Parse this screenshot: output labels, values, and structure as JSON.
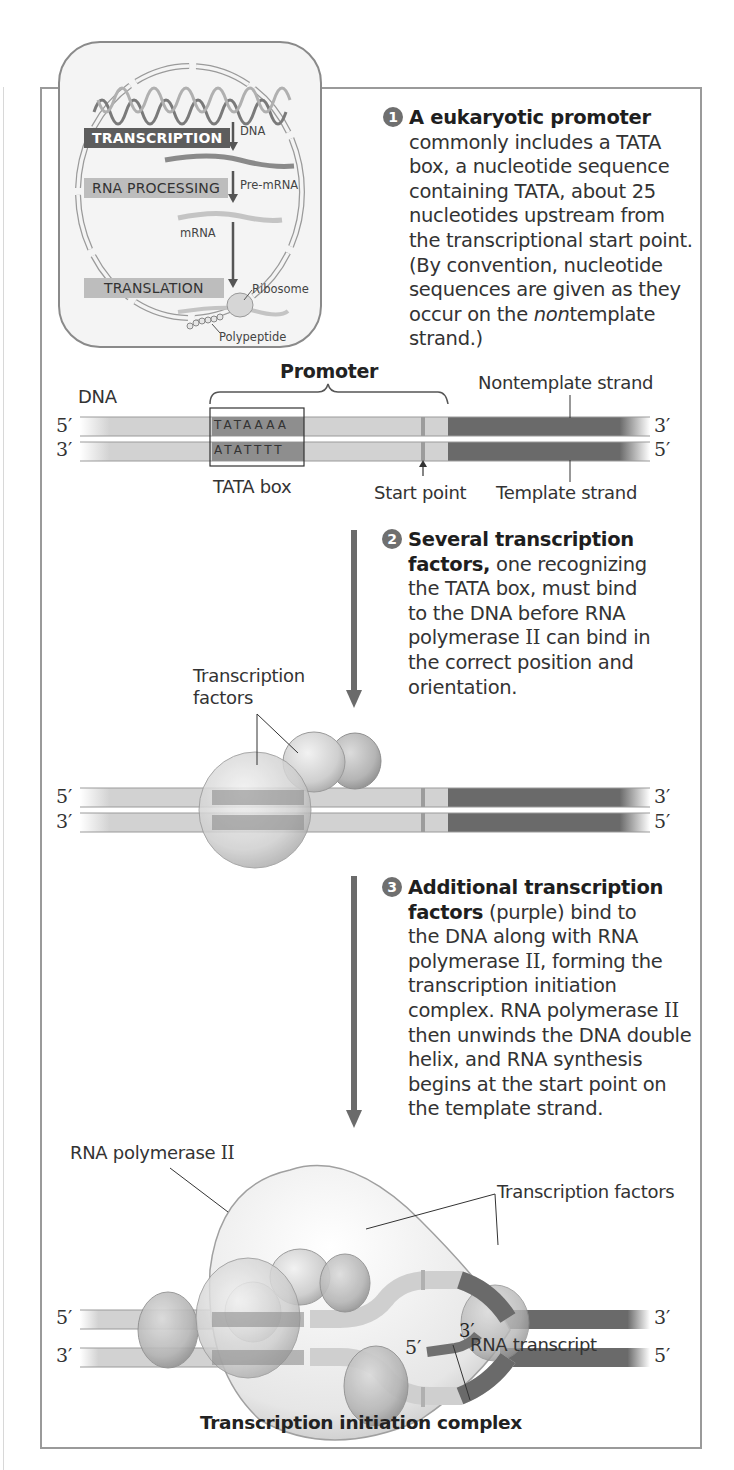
{
  "inset": {
    "labels": {
      "transcription": "TRANSCRIPTION",
      "rna_processing": "RNA PROCESSING",
      "translation": "TRANSLATION",
      "dna": "DNA",
      "pre_mrna": "Pre-mRNA",
      "mrna": "mRNA",
      "ribosome": "Ribosome",
      "polypeptide": "Polypeptide"
    }
  },
  "steps": [
    {
      "number": "1",
      "bold": "A eukaryotic promoter",
      "lines": [
        "commonly includes a TATA",
        "box, a nucleotide sequence",
        "containing TATA, about 25",
        "nucleotides upstream from",
        "the transcriptional start point.",
        "(By convention, nucleotide",
        "sequences are given as they"
      ],
      "line_last_pre": "occur on the ",
      "line_last_italic": "non",
      "line_last_post": "template",
      "line_final": "strand.)"
    },
    {
      "number": "2",
      "bold_1": "Several transcription",
      "bold_2": "factors,",
      "rest_2": " one recognizing",
      "lines": [
        "the TATA box, must bind",
        "to the DNA before RNA"
      ],
      "line_pol_pre": "polymerase ",
      "line_pol_roman": "II",
      "line_pol_post": " can bind in",
      "lines_after": [
        "the correct position and",
        "orientation."
      ]
    },
    {
      "number": "3",
      "bold_1": "Additional transcription",
      "bold_2": "factors",
      "rest_2": " (purple) bind to",
      "line_3": "the DNA along with RNA",
      "line_4_pre": "polymerase ",
      "line_4_roman": "II",
      "line_4_post": ", forming the",
      "line_5": "transcription initiation",
      "line_6_pre": "complex. RNA polymerase ",
      "line_6_roman": "II",
      "line_7": "then unwinds the DNA double",
      "line_8": "helix, and RNA synthesis",
      "line_9": "begins at the start point on",
      "line_10": "the template strand."
    }
  ],
  "panel1": {
    "promoter": "Promoter",
    "dna": "DNA",
    "nontemplate": "Nontemplate strand",
    "template": "Template strand",
    "tata_box": "TATA box",
    "start_point": "Start point",
    "top_seq": "TATAAAA",
    "bottom_seq": "ATATTTT",
    "left_top": "5′",
    "left_bottom": "3′",
    "right_top": "3′",
    "right_bottom": "5′"
  },
  "panel2": {
    "tf_label_1": "Transcription",
    "tf_label_2": "factors",
    "left_top": "5′",
    "left_bottom": "3′",
    "right_top": "3′",
    "right_bottom": "5′"
  },
  "panel3": {
    "polymerase_pre": "RNA polymerase ",
    "polymerase_roman": "II",
    "tf_label": "Transcription factors",
    "rna_transcript": "RNA transcript",
    "rna_5": "5′",
    "rna_3": "3′",
    "caption": "Transcription initiation complex",
    "left_top": "5′",
    "left_bottom": "3′",
    "right_top": "3′",
    "right_bottom": "5′"
  },
  "colors": {
    "frame": "#9a9a9a",
    "strand_light": "#cfcfcf",
    "strand_dark": "#6a6a6a",
    "tata_fill": "#8c8c8c",
    "arrow": "#6b6b6b",
    "protein": "#d4d4d4"
  }
}
